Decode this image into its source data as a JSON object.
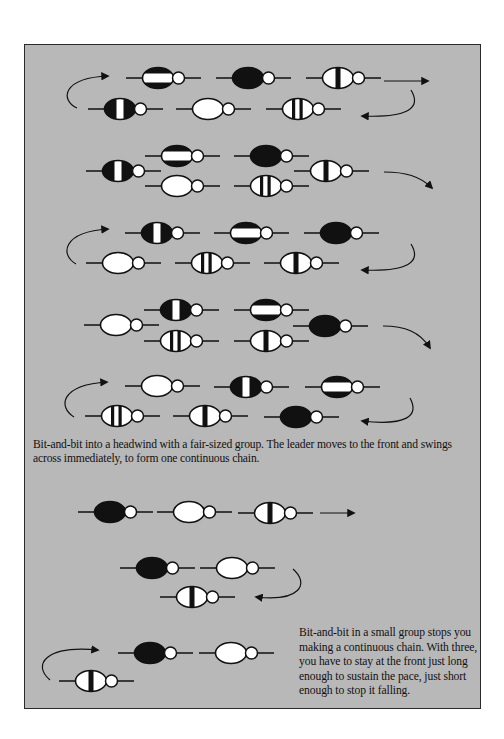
{
  "figure": {
    "panel_background": "#b8b8b8",
    "border_color": "#2a2a2a",
    "caption_large_group": "Bit-and-bit into a headwind with a fair-sized group. The leader moves to the front and swings across immediately, to form one continuous chain.",
    "caption_small_group": "Bit-and-bit in a small group stops you making a continuous chain. With three, you have to stay at the front just long enough to sustain the pace, just short enough to stop it falling."
  },
  "legend": {
    "rider_patterns": {
      "hbar": "black jersey with white horizontal band",
      "black": "solid black jersey",
      "center-stripe": "white jersey with black center stripe",
      "white-center": "black jersey with white center stripe",
      "white": "solid white jersey",
      "two-stripes": "white jersey with two black stripes"
    }
  },
  "diagrams": [
    {
      "id": "large-group-step-1",
      "riders": [
        {
          "pattern": "hbar",
          "cx": 158,
          "cy": 78
        },
        {
          "pattern": "black",
          "cx": 248,
          "cy": 78
        },
        {
          "pattern": "center-stripe",
          "cx": 338,
          "cy": 78
        },
        {
          "pattern": "white-center",
          "cx": 120,
          "cy": 109
        },
        {
          "pattern": "white",
          "cx": 208,
          "cy": 109
        },
        {
          "pattern": "two-stripes",
          "cx": 298,
          "cy": 109
        }
      ],
      "arrows": [
        {
          "type": "straight",
          "d": "M384 81 L428 81",
          "head": "428,81"
        },
        {
          "type": "curve-left-up",
          "d": "M77 108 C60 100 62 78 108 76"
        },
        {
          "type": "curve-right-down",
          "d": "M411 90 C422 108 408 118 362 116"
        }
      ]
    },
    {
      "id": "large-group-step-2",
      "riders": [
        {
          "pattern": "hbar",
          "cx": 177,
          "cy": 156
        },
        {
          "pattern": "black",
          "cx": 266,
          "cy": 156
        },
        {
          "pattern": "white-center",
          "cx": 118,
          "cy": 171
        },
        {
          "pattern": "center-stripe",
          "cx": 326,
          "cy": 171
        },
        {
          "pattern": "white",
          "cx": 177,
          "cy": 186
        },
        {
          "pattern": "two-stripes",
          "cx": 266,
          "cy": 186
        }
      ],
      "arrows": [
        {
          "type": "curve-right-down",
          "d": "M384 172 C405 172 420 176 432 188"
        }
      ]
    },
    {
      "id": "large-group-step-3",
      "riders": [
        {
          "pattern": "white-center",
          "cx": 157,
          "cy": 233
        },
        {
          "pattern": "hbar",
          "cx": 246,
          "cy": 233
        },
        {
          "pattern": "black",
          "cx": 336,
          "cy": 233
        },
        {
          "pattern": "white",
          "cx": 118,
          "cy": 263
        },
        {
          "pattern": "two-stripes",
          "cx": 207,
          "cy": 263
        },
        {
          "pattern": "center-stripe",
          "cx": 296,
          "cy": 263
        }
      ],
      "arrows": [
        {
          "type": "curve-left-up",
          "d": "M76 264 C60 255 62 232 108 229"
        },
        {
          "type": "curve-right-down",
          "d": "M411 244 C422 262 408 272 362 270"
        }
      ]
    },
    {
      "id": "large-group-step-4",
      "riders": [
        {
          "pattern": "white-center",
          "cx": 176,
          "cy": 310
        },
        {
          "pattern": "hbar",
          "cx": 266,
          "cy": 310
        },
        {
          "pattern": "white",
          "cx": 116,
          "cy": 325
        },
        {
          "pattern": "black",
          "cx": 325,
          "cy": 326
        },
        {
          "pattern": "two-stripes",
          "cx": 176,
          "cy": 341
        },
        {
          "pattern": "center-stripe",
          "cx": 266,
          "cy": 341
        }
      ],
      "arrows": [
        {
          "type": "curve-right-down",
          "d": "M383 326 C405 326 420 332 430 348"
        }
      ]
    },
    {
      "id": "large-group-step-5",
      "riders": [
        {
          "pattern": "white",
          "cx": 157,
          "cy": 386
        },
        {
          "pattern": "white-center",
          "cx": 246,
          "cy": 387
        },
        {
          "pattern": "hbar",
          "cx": 337,
          "cy": 387
        },
        {
          "pattern": "two-stripes",
          "cx": 117,
          "cy": 416
        },
        {
          "pattern": "center-stripe",
          "cx": 205,
          "cy": 416
        },
        {
          "pattern": "black",
          "cx": 296,
          "cy": 417
        }
      ],
      "arrows": [
        {
          "type": "curve-left-up",
          "d": "M74 417 C58 407 60 385 107 382"
        },
        {
          "type": "curve-right-down",
          "d": "M410 398 C420 416 406 426 362 421"
        }
      ]
    },
    {
      "id": "small-group-step-1",
      "riders": [
        {
          "pattern": "black",
          "cx": 110,
          "cy": 512
        },
        {
          "pattern": "white",
          "cx": 189,
          "cy": 512
        },
        {
          "pattern": "center-stripe",
          "cx": 270,
          "cy": 513
        }
      ],
      "arrows": [
        {
          "type": "straight",
          "d": "M320 513 L354 513",
          "head": "354,513"
        }
      ]
    },
    {
      "id": "small-group-step-2",
      "riders": [
        {
          "pattern": "black",
          "cx": 152,
          "cy": 568
        },
        {
          "pattern": "white",
          "cx": 232,
          "cy": 568
        },
        {
          "pattern": "center-stripe",
          "cx": 192,
          "cy": 597
        }
      ],
      "arrows": [
        {
          "type": "curve-right-down",
          "d": "M293 569 C310 584 300 602 256 597"
        }
      ]
    },
    {
      "id": "small-group-step-3",
      "riders": [
        {
          "pattern": "black",
          "cx": 150,
          "cy": 653
        },
        {
          "pattern": "white",
          "cx": 231,
          "cy": 653
        },
        {
          "pattern": "center-stripe",
          "cx": 91,
          "cy": 681
        }
      ],
      "arrows": [
        {
          "type": "curve-left-up",
          "d": "M50 680 C32 665 45 645 98 650"
        }
      ]
    }
  ]
}
